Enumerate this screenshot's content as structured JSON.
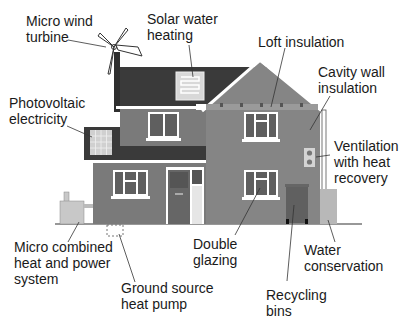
{
  "diagram": {
    "colors": {
      "wall": "#7a7a7a",
      "wall_light": "#8a8a8a",
      "roof": "#3a3a3a",
      "trim": "#ffffff",
      "ground_line": "#333333",
      "text": "#1a1a1a"
    },
    "labels": [
      {
        "id": "micro-wind-turbine",
        "lines": [
          "Micro wind",
          "turbine"
        ]
      },
      {
        "id": "solar-water-heating",
        "lines": [
          "Solar water",
          "heating"
        ]
      },
      {
        "id": "loft-insulation",
        "lines": [
          "Loft insulation"
        ]
      },
      {
        "id": "cavity-wall-insulation",
        "lines": [
          "Cavity wall",
          "insulation"
        ]
      },
      {
        "id": "photovoltaic-electricity",
        "lines": [
          "Photovoltaic",
          "electricity"
        ]
      },
      {
        "id": "ventilation-heat-recovery",
        "lines": [
          "Ventilation",
          "with heat",
          "recovery"
        ]
      },
      {
        "id": "micro-chp",
        "lines": [
          "Micro combined",
          "heat and power",
          "system"
        ]
      },
      {
        "id": "double-glazing",
        "lines": [
          "Double",
          "glazing"
        ]
      },
      {
        "id": "water-conservation",
        "lines": [
          "Water",
          "conservation"
        ]
      },
      {
        "id": "ground-source-heat-pump",
        "lines": [
          "Ground source",
          "heat pump"
        ]
      },
      {
        "id": "recycling-bins",
        "lines": [
          "Recycling",
          "bins"
        ]
      }
    ]
  }
}
